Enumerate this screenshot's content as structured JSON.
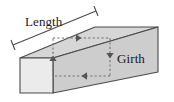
{
  "figure": {
    "kind": "geometry-diagram",
    "background_color": "#ffffff",
    "labels": {
      "length": "Length",
      "girth": "Girth"
    },
    "colors": {
      "front_face": "#e9e9e9",
      "top_face": "#d4d4d4",
      "side_face": "#c9c9c9",
      "outline": "#4a4a4a",
      "dashed_line": "#6b6b6b",
      "dimension_line": "#4a4a4a",
      "text": "#1a1a1a"
    },
    "solid": {
      "name": "rectangular-prism",
      "front_face_points": "20,58 53,58 53,93 20,93",
      "top_face_points": "20,58 95,27 158,27 53,58",
      "side_face_points": "53,58 158,27 158,72 53,93",
      "hidden_note": "only three faces visible in the isometric view"
    },
    "length_dimension": {
      "name": "length-measure",
      "line_from": "13,45",
      "line_to": "96,11",
      "tick_start_from": "10,40",
      "tick_start_to": "16,50",
      "tick_end_from": "93,6",
      "tick_end_to": "99,16"
    },
    "girth_path": {
      "name": "girth-measure",
      "description": "dashed rectangle around the box cross-section with four directional arrows",
      "segments": [
        {
          "name": "girth-top-dashed",
          "from": "53,38",
          "to": "110,38",
          "arrow": "right",
          "arrow_at": "80,38"
        },
        {
          "name": "girth-right-dashed",
          "from": "110,38",
          "to": "110,75",
          "arrow": "down",
          "arrow_at": "110,57"
        },
        {
          "name": "girth-bottom-dashed",
          "from": "110,75",
          "to": "53,75",
          "arrow": "left",
          "arrow_at": "82,75"
        },
        {
          "name": "girth-left-dashed",
          "from": "53,75",
          "to": "53,38",
          "arrow": "up",
          "arrow_at": "53,57"
        }
      ]
    }
  }
}
